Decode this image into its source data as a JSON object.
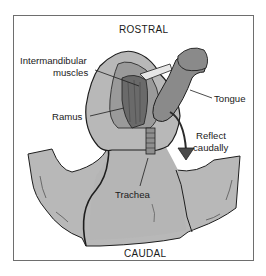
{
  "diagram": {
    "orientation": {
      "top": "ROSTRAL",
      "bottom": "CAUDAL"
    },
    "labels": {
      "intermandibular_line1": "Intermandibular",
      "intermandibular_line2": "muscles",
      "ramus": "Ramus",
      "tongue": "Tongue",
      "reflect_line1": "Reflect",
      "reflect_line2": "caudally",
      "trachea": "Trachea"
    },
    "colors": {
      "skin": "#b8b8b8",
      "muscle": "#6a6a6a",
      "tongue": "#8a8a8a",
      "outline": "#1e1e1e",
      "frame": "#6e6e6e",
      "arrow": "#4a4a4a"
    }
  }
}
